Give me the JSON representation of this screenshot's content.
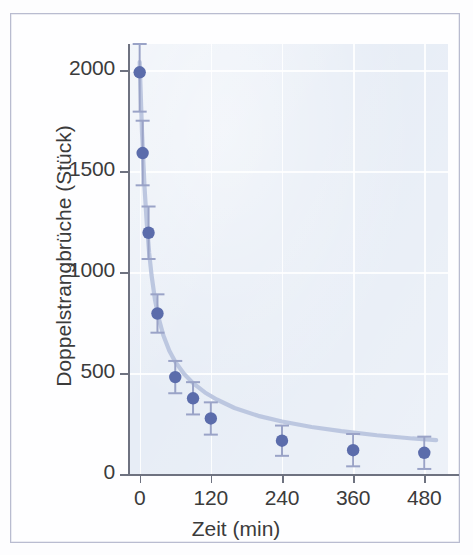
{
  "chart_data": {
    "type": "scatter",
    "title": "",
    "xlabel": "Zeit (min)",
    "ylabel": "Doppelstrangbrüche (Stück)",
    "xlim": [
      -18,
      520
    ],
    "ylim": [
      0,
      2130
    ],
    "xticks": [
      0,
      120,
      240,
      360,
      480
    ],
    "xticklabels": [
      "0",
      "120",
      "240",
      "360",
      "480"
    ],
    "yticks": [
      0,
      500,
      1000,
      1500,
      2000
    ],
    "yticklabels": [
      "0",
      "500",
      "1000",
      "1500",
      "2000"
    ],
    "grid": true,
    "legend": false,
    "marker_color": "#5b6cab",
    "errorbar_color": "#9aa3c7",
    "fitline_color": "#b9c4de",
    "plot_background": "#e7edf6",
    "gridline_color": "#ffffff",
    "axis_color": "#6e7280",
    "frame_color": "#b9bcd0",
    "series": [
      {
        "name": "Doppelstrangbrüche",
        "x": [
          0,
          5,
          15,
          30,
          60,
          90,
          120,
          240,
          360,
          480
        ],
        "values": [
          1990,
          1590,
          1195,
          795,
          480,
          375,
          275,
          165,
          118,
          105
        ],
        "yerr": [
          195,
          160,
          130,
          95,
          80,
          80,
          80,
          75,
          80,
          80
        ]
      }
    ],
    "fit_curve": {
      "description": "exponential decay fit through the data points",
      "x": [
        0,
        4,
        8,
        12,
        16,
        20,
        26,
        32,
        40,
        50,
        60,
        75,
        90,
        110,
        130,
        160,
        200,
        240,
        290,
        340,
        400,
        460,
        500
      ],
      "y": [
        2040,
        1690,
        1430,
        1240,
        1095,
        985,
        860,
        772,
        686,
        610,
        556,
        495,
        450,
        404,
        369,
        327,
        288,
        260,
        233,
        212,
        192,
        176,
        168
      ]
    }
  },
  "axis": {
    "ylabel": "Doppelstrangbrüche (Stück)",
    "xlabel": "Zeit (min)",
    "yticklabels": [
      "2000",
      "1500",
      "1000",
      "500",
      "0"
    ],
    "xticklabels": [
      "0",
      "120",
      "240",
      "360",
      "480"
    ]
  }
}
